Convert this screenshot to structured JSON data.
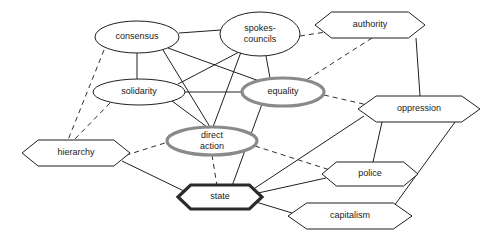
{
  "diagram": {
    "background": "#ffffff",
    "styles": {
      "thin_stroke": "#1f1f1f",
      "gray_highlight": "#8a8a8a",
      "dark_highlight": "#2b2b2b",
      "solid_edge": "#202020",
      "dashed_edge": "#303030"
    },
    "nodes": [
      {
        "id": "consensus",
        "label": "consensus",
        "label2": "",
        "shape": "ellipse",
        "emphasis": "thin",
        "cx": 137,
        "cy": 37,
        "rx": 42,
        "ry": 16
      },
      {
        "id": "spokes-councils",
        "label": "spokes-",
        "label2": "councils",
        "shape": "ellipse",
        "emphasis": "thin",
        "cx": 260,
        "cy": 34,
        "rx": 40,
        "ry": 22
      },
      {
        "id": "authority",
        "label": "authority",
        "label2": "",
        "shape": "hexagon",
        "emphasis": "thin",
        "cx": 370,
        "cy": 25,
        "rx": 55,
        "ry": 13
      },
      {
        "id": "solidarity",
        "label": "solidarity",
        "label2": "",
        "shape": "ellipse",
        "emphasis": "thin",
        "cx": 139,
        "cy": 92,
        "rx": 46,
        "ry": 13
      },
      {
        "id": "equality",
        "label": "equality",
        "label2": "",
        "shape": "ellipse",
        "emphasis": "gray",
        "cx": 283,
        "cy": 92,
        "rx": 41,
        "ry": 14
      },
      {
        "id": "oppression",
        "label": "oppression",
        "label2": "",
        "shape": "hexagon",
        "emphasis": "thin",
        "cx": 419,
        "cy": 109,
        "rx": 61,
        "ry": 13
      },
      {
        "id": "direct-action",
        "label": "direct",
        "label2": "action",
        "shape": "ellipse",
        "emphasis": "gray",
        "cx": 212,
        "cy": 141,
        "rx": 45,
        "ry": 14
      },
      {
        "id": "hierarchy",
        "label": "hierarchy",
        "label2": "",
        "shape": "hexagon",
        "emphasis": "thin",
        "cx": 76,
        "cy": 153,
        "rx": 54,
        "ry": 13
      },
      {
        "id": "police",
        "label": "police",
        "label2": "",
        "shape": "hexagon",
        "emphasis": "thin",
        "cx": 370,
        "cy": 174,
        "rx": 48,
        "ry": 12
      },
      {
        "id": "state",
        "label": "state",
        "label2": "",
        "shape": "hexagon",
        "emphasis": "dark",
        "cx": 220,
        "cy": 197,
        "rx": 42,
        "ry": 12
      },
      {
        "id": "capitalism",
        "label": "capitalism",
        "label2": "",
        "shape": "hexagon",
        "emphasis": "thin",
        "cx": 350,
        "cy": 216,
        "rx": 62,
        "ry": 13
      }
    ],
    "edges": [
      {
        "from": "consensus",
        "to": "spokes-councils",
        "style": "solid",
        "x1": 179,
        "y1": 33,
        "x2": 221,
        "y2": 30
      },
      {
        "from": "consensus",
        "to": "solidarity",
        "style": "solid",
        "x1": 137,
        "y1": 53,
        "x2": 137,
        "y2": 79
      },
      {
        "from": "consensus",
        "to": "equality",
        "style": "solid",
        "x1": 168,
        "y1": 48,
        "x2": 262,
        "y2": 82
      },
      {
        "from": "consensus",
        "to": "direct-action",
        "style": "solid",
        "x1": 163,
        "y1": 50,
        "x2": 210,
        "y2": 127
      },
      {
        "from": "solidarity",
        "to": "spokes-councils",
        "style": "solid",
        "x1": 178,
        "y1": 84,
        "x2": 241,
        "y2": 51
      },
      {
        "from": "solidarity",
        "to": "equality",
        "style": "solid",
        "x1": 185,
        "y1": 92,
        "x2": 242,
        "y2": 92
      },
      {
        "from": "solidarity",
        "to": "direct-action",
        "style": "solid",
        "x1": 172,
        "y1": 101,
        "x2": 207,
        "y2": 127
      },
      {
        "from": "spokes-councils",
        "to": "direct-action",
        "style": "solid",
        "x1": 241,
        "y1": 52,
        "x2": 213,
        "y2": 127
      },
      {
        "from": "spokes-councils",
        "to": "equality",
        "style": "solid",
        "x1": 266,
        "y1": 56,
        "x2": 270,
        "y2": 78
      },
      {
        "from": "spokes-councils",
        "to": "authority",
        "style": "dashed",
        "x1": 300,
        "y1": 36,
        "x2": 332,
        "y2": 31
      },
      {
        "from": "authority",
        "to": "equality",
        "style": "dashed",
        "x1": 372,
        "y1": 38,
        "x2": 300,
        "y2": 84
      },
      {
        "from": "authority",
        "to": "oppression",
        "style": "solid",
        "x1": 416,
        "y1": 38,
        "x2": 420,
        "y2": 96
      },
      {
        "from": "equality",
        "to": "oppression",
        "style": "dashed",
        "x1": 324,
        "y1": 95,
        "x2": 372,
        "y2": 106
      },
      {
        "from": "equality",
        "to": "state",
        "style": "solid",
        "x1": 262,
        "y1": 104,
        "x2": 232,
        "y2": 186
      },
      {
        "from": "consensus",
        "to": "hierarchy",
        "style": "dashed",
        "x1": 104,
        "y1": 50,
        "x2": 68,
        "y2": 140
      },
      {
        "from": "solidarity",
        "to": "hierarchy",
        "style": "dashed",
        "x1": 110,
        "y1": 103,
        "x2": 74,
        "y2": 140
      },
      {
        "from": "hierarchy",
        "to": "direct-action",
        "style": "dashed",
        "x1": 117,
        "y1": 158,
        "x2": 200,
        "y2": 132
      },
      {
        "from": "hierarchy",
        "to": "state",
        "style": "solid",
        "x1": 122,
        "y1": 161,
        "x2": 186,
        "y2": 192
      },
      {
        "from": "direct-action",
        "to": "state",
        "style": "dashed",
        "x1": 212,
        "y1": 155,
        "x2": 217,
        "y2": 186
      },
      {
        "from": "direct-action",
        "to": "police",
        "style": "dashed",
        "x1": 255,
        "y1": 146,
        "x2": 330,
        "y2": 170
      },
      {
        "from": "oppression",
        "to": "police",
        "style": "solid",
        "x1": 382,
        "y1": 122,
        "x2": 373,
        "y2": 162
      },
      {
        "from": "oppression",
        "to": "capitalism",
        "style": "solid",
        "x1": 455,
        "y1": 122,
        "x2": 394,
        "y2": 206
      },
      {
        "from": "oppression",
        "to": "state",
        "style": "solid",
        "x1": 364,
        "y1": 116,
        "x2": 252,
        "y2": 190
      },
      {
        "from": "state",
        "to": "police",
        "style": "solid",
        "x1": 258,
        "y1": 193,
        "x2": 326,
        "y2": 178
      },
      {
        "from": "state",
        "to": "capitalism",
        "style": "solid",
        "x1": 256,
        "y1": 202,
        "x2": 292,
        "y2": 213
      }
    ]
  }
}
